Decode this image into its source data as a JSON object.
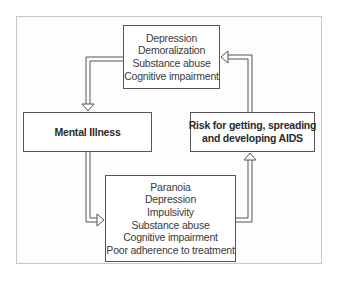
{
  "diagram": {
    "type": "cycle-flowchart",
    "nodes": {
      "top": {
        "lines": [
          "Depression",
          "Demoralization",
          "Substance abuse",
          "Cognitive impairment"
        ]
      },
      "left": {
        "lines": [
          "Mental Illness"
        ]
      },
      "right": {
        "lines": [
          "Risk for getting, spreading",
          "and developing AIDS"
        ]
      },
      "bottom": {
        "lines": [
          "Paranoia",
          "Depression",
          "Impulsivity",
          "Substance abuse",
          "Cognitive impairment",
          "Poor adherence to treatment"
        ]
      }
    },
    "edges": [
      {
        "from": "top",
        "to": "left"
      },
      {
        "from": "left",
        "to": "bottom"
      },
      {
        "from": "bottom",
        "to": "right"
      },
      {
        "from": "right",
        "to": "top"
      }
    ],
    "colors": {
      "border": "#555555",
      "frame": "#c8c8c8",
      "text": "#3a3a3a"
    }
  }
}
